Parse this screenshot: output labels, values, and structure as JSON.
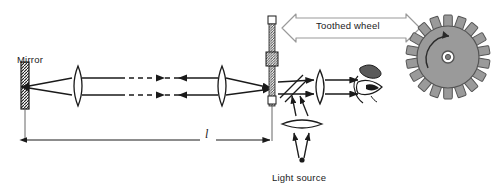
{
  "figure": {
    "type": "optics-ray-diagram",
    "width": 494,
    "height": 193,
    "background": "#ffffff",
    "ink_color": "#1a1a1a",
    "gear_fill": "#9a9a9a",
    "gear_stroke": "#555555",
    "banner_stroke": "#9a9a9a"
  },
  "labels": {
    "mirror": "Mirror",
    "toothed_wheel": "Toothed wheel",
    "light_source": "Light source",
    "distance": "l"
  },
  "components": [
    {
      "name": "mirror",
      "kind": "hatched-bar",
      "x": 25,
      "y_top": 62,
      "y_bottom": 108
    },
    {
      "name": "collimating-lens-left",
      "kind": "biconvex-lens",
      "x": 78,
      "cy": 86
    },
    {
      "name": "collimating-lens-right",
      "kind": "biconvex-lens",
      "x": 222,
      "cy": 86
    },
    {
      "name": "eyepiece-lens",
      "kind": "biconvex-lens",
      "x": 320,
      "cy": 87
    },
    {
      "name": "condenser-lens",
      "kind": "biconvex-lens-horizontal",
      "cx": 302,
      "cy": 124
    },
    {
      "name": "beam-splitter",
      "kind": "tilted-plate",
      "cx": 292,
      "cy": 87,
      "angle_deg": -45
    },
    {
      "name": "toothed-wheel-rod",
      "kind": "hatched-rod",
      "x": 272,
      "y_top": 16,
      "y_bottom": 100
    },
    {
      "name": "toothed-wheel",
      "kind": "gear",
      "cx": 448,
      "cy": 57,
      "radius": 40,
      "teeth": 18
    },
    {
      "name": "observer-eye",
      "kind": "eye-profile",
      "cx": 372,
      "cy": 88
    },
    {
      "name": "light-source",
      "kind": "point-source",
      "cx": 302,
      "cy": 160
    }
  ],
  "rays": {
    "upper_y": 78,
    "lower_y": 95,
    "dashed_break": {
      "x_start": 120,
      "x_end": 178
    },
    "bidirectional": true
  },
  "dimension": {
    "label": "l",
    "x_start": 25,
    "x_end": 272,
    "y": 140,
    "double_headed": true
  },
  "banner": {
    "label": "Toothed wheel",
    "x_left": 282,
    "x_right": 420,
    "y": 28,
    "double_headed": true
  },
  "rotation_arrow": {
    "on": "toothed-wheel",
    "direction": "clockwise"
  }
}
